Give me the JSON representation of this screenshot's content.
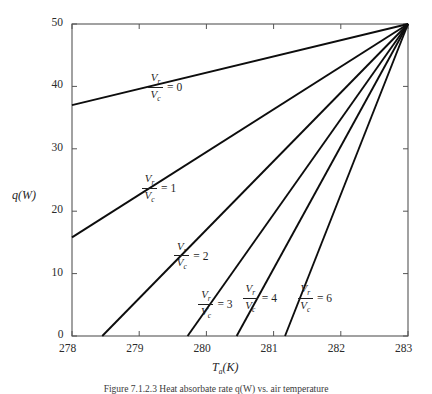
{
  "figure": {
    "caption": "Figure 7.1.2.3   Heat absorbate rate q(W) vs. air temperature"
  },
  "chart_data": {
    "type": "line",
    "title": "",
    "xlabel": "T_a(K)",
    "ylabel": "q(W)",
    "xlim": [
      278,
      283
    ],
    "ylim": [
      0,
      50
    ],
    "xticks": [
      278,
      279,
      280,
      281,
      282,
      283
    ],
    "yticks": [
      0,
      10,
      20,
      30,
      40,
      50
    ],
    "xtick_labels": [
      "278",
      "279",
      "280",
      "281",
      "282",
      "283"
    ],
    "ytick_labels": [
      "0",
      "10",
      "20",
      "30",
      "40",
      "50"
    ],
    "grid": false,
    "legend": "inline-annotations",
    "convergence_point": {
      "x": 283,
      "y": 50
    },
    "series": [
      {
        "name": "Vr/Vc = 0",
        "ratio_value": "0",
        "x": [
          278,
          283
        ],
        "y": [
          37.0,
          50.0
        ],
        "label_x": 279.37,
        "label_y": 40.2
      },
      {
        "name": "Vr/Vc = 1",
        "ratio_value": "1",
        "x": [
          278,
          283
        ],
        "y": [
          15.8,
          50.0
        ],
        "label_x": 279.28,
        "label_y": 24.0
      },
      {
        "name": "Vr/Vc = 2",
        "ratio_value": "2",
        "x": [
          278.45,
          283
        ],
        "y": [
          0.0,
          50.0
        ],
        "label_x": 279.76,
        "label_y": 13.2
      },
      {
        "name": "Vr/Vc = 3",
        "ratio_value": "3",
        "x": [
          279.72,
          283
        ],
        "y": [
          0.0,
          50.0
        ],
        "label_x": 280.12,
        "label_y": 5.4
      },
      {
        "name": "Vr/Vc = 4",
        "ratio_value": "4",
        "x": [
          280.45,
          283
        ],
        "y": [
          0.0,
          50.0
        ],
        "label_x": 280.78,
        "label_y": 6.4
      },
      {
        "name": "Vr/Vc = 6",
        "ratio_value": "6",
        "x": [
          281.17,
          283
        ],
        "y": [
          0.0,
          50.0
        ],
        "label_x": 281.6,
        "label_y": 6.4
      }
    ],
    "ratio_numerator": "V",
    "ratio_numerator_sub": "r",
    "ratio_denominator": "V",
    "ratio_denominator_sub": "c",
    "equals_sign": "="
  }
}
